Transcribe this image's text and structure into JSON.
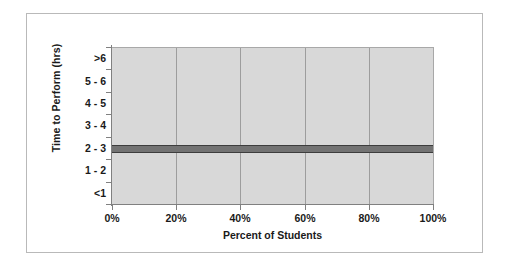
{
  "chart_data": {
    "type": "bar",
    "orientation": "horizontal",
    "title": "",
    "xlabel": "Percent of Students",
    "ylabel": "Time to Perform (hrs)",
    "categories": [
      ">6",
      "5 - 6",
      "4 - 5",
      "3 - 4",
      "2 - 3",
      "1 - 2",
      "<1"
    ],
    "values": [
      0,
      0,
      0,
      0,
      100,
      0,
      0
    ],
    "xlim": [
      0,
      100
    ],
    "x_tick_labels": [
      "0%",
      "20%",
      "40%",
      "60%",
      "80%",
      "100%"
    ],
    "x_tick_values": [
      0,
      20,
      40,
      60,
      80,
      100
    ],
    "grid": "vertical",
    "legend": "none",
    "series": [
      {
        "name": "Percent of Students",
        "values": [
          0,
          0,
          0,
          0,
          100,
          0,
          0
        ]
      }
    ],
    "colors": {
      "bar_fill": "#737373",
      "bar_edge": "#3d3d3d",
      "plot_background": "#d8d8d8",
      "gridline": "#9d9d9d",
      "axis": "#808080",
      "text": "#1a1a1a",
      "figure_border": "#b9b9b9"
    }
  }
}
